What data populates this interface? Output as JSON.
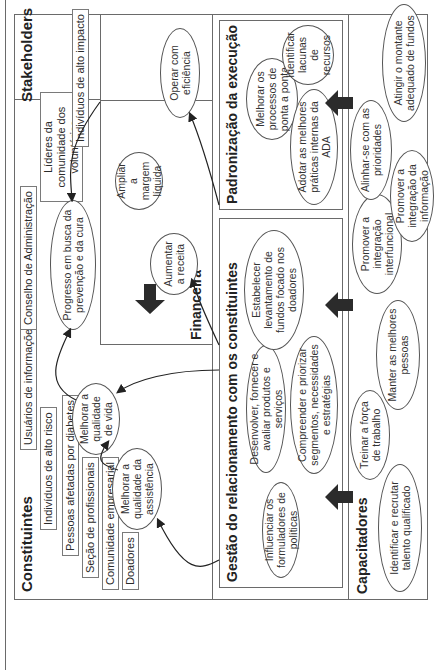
{
  "diagram": {
    "top_section": {
      "constituents": {
        "title": "Constituintes",
        "tags": [
          "Doadores",
          "Comunidade empresarial",
          "Seção de profissionais",
          "Pessoas afetadas por diabetes",
          "Indivíduos de alto risco",
          "Usuários de informações"
        ]
      },
      "stakeholders": {
        "title": "Stakeholders",
        "tags": [
          "Conselho de Administração",
          "Líderes da comunidade dos voluntários",
          "Indivíduos de alto impacto"
        ]
      },
      "outcomes": {
        "quality_of_care": "Melhorar a qualidade da assistência",
        "quality_of_life": "Melhorar a qualidade de vida",
        "progress": "Progresso em busca da prevenção e da cura"
      },
      "financial": {
        "title": "Financeira",
        "items": [
          "Aumentar a receita",
          "Ampliar a margem líquida",
          "Operar com eficiência"
        ]
      }
    },
    "processes": {
      "relationship": {
        "title": "Gestão do relacionamento com os constituintes",
        "items": [
          "Influenciar os formuladores de políticas",
          "Desenvolver, fornecer e avaliar produtos e serviços",
          "Compreender e priorizar segmentos, necessidades e estratégias",
          "Estabelecer levantamento de fundos focado nos doadores"
        ]
      },
      "execution": {
        "title": "Padronização da execução",
        "items": [
          "Melhorar os processos de ponta a ponta",
          "Adotar as melhores práticas internas da ADA",
          "Identificar lacunas de recursos"
        ]
      }
    },
    "enablers": {
      "title": "Capacitadores",
      "items": [
        "Identificar e recrutar talento qualificado",
        "Treinar a força de trabalho",
        "Manter as melhores pessoas",
        "Promover a integração interfuncional",
        "Promover a integração da informação",
        "Alinhar-se com as prioridades",
        "Atingir o montante adequado de fundos"
      ]
    },
    "colors": {
      "line": "#6a6a6a",
      "arrow_block": "#2b2b2b",
      "text": "#2a2a2a"
    }
  }
}
